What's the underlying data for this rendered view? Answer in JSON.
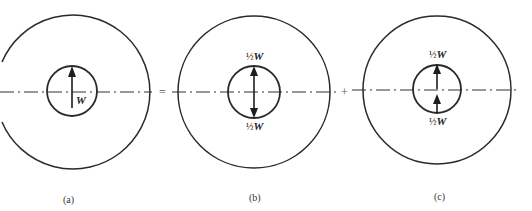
{
  "figure": {
    "operators": {
      "equals": "=",
      "plus": "+"
    },
    "panels": [
      {
        "id": "a",
        "caption": "(a)",
        "outer_circle": {
          "cx": 73,
          "cy": 92,
          "r": 77
        },
        "inner_circle": {
          "cx": 72,
          "cy": 91,
          "r": 25
        },
        "forces": [
          {
            "direction": "up",
            "from_y": 108,
            "to_y": 67,
            "label_fraction": "",
            "label_symbol": "W",
            "label_position": "lower-right"
          }
        ]
      },
      {
        "id": "b",
        "caption": "(b)",
        "outer_circle": {
          "cx": 254,
          "cy": 92,
          "r": 76
        },
        "inner_circle": {
          "cx": 254,
          "cy": 92,
          "r": 26
        },
        "forces": [
          {
            "direction": "up",
            "from_y": 92,
            "to_y": 66,
            "label_fraction": "½",
            "label_symbol": "W",
            "label_position": "above"
          },
          {
            "direction": "down",
            "from_y": 92,
            "to_y": 118,
            "label_fraction": "½",
            "label_symbol": "W",
            "label_position": "below"
          }
        ]
      },
      {
        "id": "c",
        "caption": "(c)",
        "outer_circle": {
          "cx": 437,
          "cy": 90,
          "r": 74
        },
        "inner_circle": {
          "cx": 437,
          "cy": 89,
          "r": 24
        },
        "forces": [
          {
            "direction": "up",
            "from_y": 89,
            "to_y": 65,
            "label_fraction": "½",
            "label_symbol": "W",
            "label_position": "above"
          },
          {
            "direction": "up",
            "from_y": 113,
            "to_y": 94,
            "label_fraction": "½",
            "label_symbol": "W",
            "label_position": "below"
          }
        ]
      }
    ]
  }
}
